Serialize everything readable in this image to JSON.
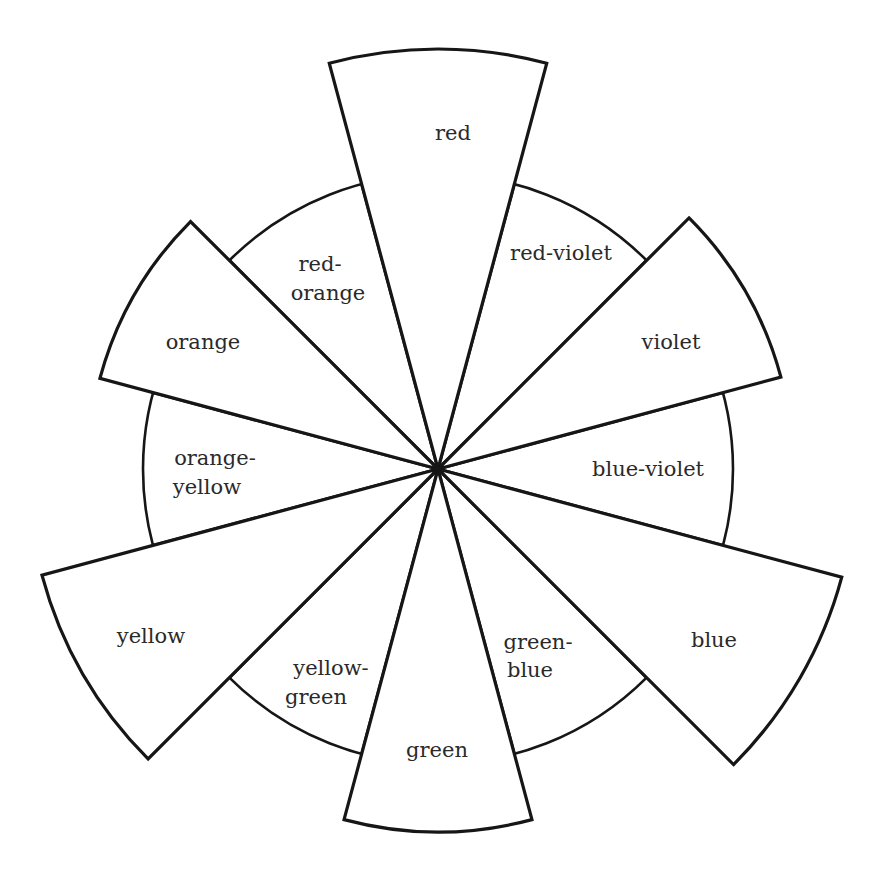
{
  "diagram": {
    "center": {
      "x": 438,
      "y": 469
    },
    "inner_radius": 295,
    "sector_span_deg": 30,
    "stroke_color": "#161616",
    "text_color": "#2a2a2a",
    "background": "#ffffff",
    "sectors": [
      {
        "name": "red",
        "lines": [
          "red"
        ],
        "angle": 0,
        "primary": true,
        "outer_radius": 420,
        "label_pos": [
          [
            453,
            140
          ]
        ]
      },
      {
        "name": "red-violet",
        "lines": [
          "red-violet"
        ],
        "angle": 30,
        "primary": false,
        "outer_radius": 295,
        "label_pos": [
          [
            561,
            260
          ]
        ]
      },
      {
        "name": "violet",
        "lines": [
          "violet"
        ],
        "angle": 60,
        "primary": true,
        "outer_radius": 355,
        "label_pos": [
          [
            671,
            349
          ]
        ]
      },
      {
        "name": "blue-violet",
        "lines": [
          "blue-violet"
        ],
        "angle": 90,
        "primary": false,
        "outer_radius": 295,
        "label_pos": [
          [
            648,
            476
          ]
        ]
      },
      {
        "name": "blue",
        "lines": [
          "blue"
        ],
        "angle": 120,
        "primary": true,
        "outer_radius": 418,
        "label_pos": [
          [
            714,
            647
          ]
        ]
      },
      {
        "name": "green-blue",
        "lines": [
          "green-",
          "blue"
        ],
        "angle": 150,
        "primary": false,
        "outer_radius": 295,
        "label_pos": [
          [
            538,
            649
          ],
          [
            530,
            677
          ]
        ]
      },
      {
        "name": "green",
        "lines": [
          "green"
        ],
        "angle": 180,
        "primary": true,
        "outer_radius": 363,
        "label_pos": [
          [
            437,
            757
          ]
        ]
      },
      {
        "name": "yellow-green",
        "lines": [
          "yellow-",
          "green"
        ],
        "angle": 210,
        "primary": false,
        "outer_radius": 295,
        "label_pos": [
          [
            331,
            675
          ],
          [
            316,
            704
          ]
        ]
      },
      {
        "name": "yellow",
        "lines": [
          "yellow"
        ],
        "angle": 240,
        "primary": true,
        "outer_radius": 410,
        "label_pos": [
          [
            151,
            643
          ]
        ]
      },
      {
        "name": "orange-yellow",
        "lines": [
          "orange-",
          "yellow"
        ],
        "angle": 270,
        "primary": false,
        "outer_radius": 295,
        "label_pos": [
          [
            215,
            465
          ],
          [
            207,
            494
          ]
        ]
      },
      {
        "name": "orange",
        "lines": [
          "orange"
        ],
        "angle": 300,
        "primary": true,
        "outer_radius": 350,
        "label_pos": [
          [
            203,
            349
          ]
        ]
      },
      {
        "name": "red-orange",
        "lines": [
          "red-",
          "orange"
        ],
        "angle": 330,
        "primary": false,
        "outer_radius": 295,
        "label_pos": [
          [
            320,
            271
          ],
          [
            328,
            300
          ]
        ]
      }
    ]
  }
}
